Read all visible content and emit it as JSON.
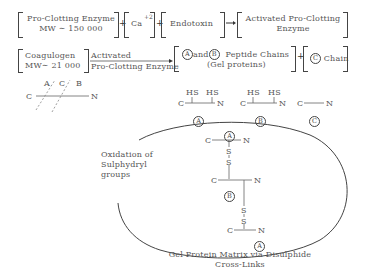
{
  "row1": {
    "proclotting": {
      "name": "Pro-Clotting Enzyme",
      "mw": "MW ∼ 150 000"
    },
    "plus1": "+",
    "calcium": {
      "symbol": "Ca",
      "charge": "+2"
    },
    "plus2": "+",
    "endotoxin": "Endotoxin",
    "activated": {
      "line1": "Activated Pro-Clotting",
      "line2": "Enzyme"
    }
  },
  "row2": {
    "coagulogen": {
      "name": "Coagulogen",
      "mw": "MW∼ 21 000"
    },
    "arrow_label": {
      "line1": "Activated",
      "line2": "Pro-Clotting Enzyme"
    },
    "peptides": {
      "a": "A",
      "and": "and",
      "b": "B",
      "label": "Peptide Chains",
      "sub": "(Gel proteins)"
    },
    "plus": "+",
    "c_chain": {
      "c": "C",
      "label": "Chain"
    }
  },
  "cleavage": {
    "c_end": "C",
    "n_end": "N",
    "sites": [
      "A",
      "C",
      "B"
    ]
  },
  "chains": [
    {
      "id": "A",
      "c_end": "C",
      "n_end": "N",
      "groups": [
        "HS",
        "HS"
      ]
    },
    {
      "id": "B",
      "c_end": "C",
      "n_end": "N",
      "groups": [
        "HS",
        "HS"
      ]
    },
    {
      "id": "C",
      "c_end": "C",
      "n_end": "N",
      "groups": []
    }
  ],
  "matrix": {
    "oxidation_label": [
      "Oxidation of",
      "Sulphydryl",
      "groups"
    ],
    "units": [
      {
        "id": "A",
        "c_end": "C",
        "n_end": "N"
      },
      {
        "id": "B",
        "c_end": "C",
        "n_end": "N"
      },
      {
        "id": "A",
        "c_end": "C",
        "n_end": "N"
      }
    ],
    "sulfur": "S",
    "caption": [
      "Gel Protein Matrix via Disulphide",
      "Cross-Links"
    ]
  }
}
